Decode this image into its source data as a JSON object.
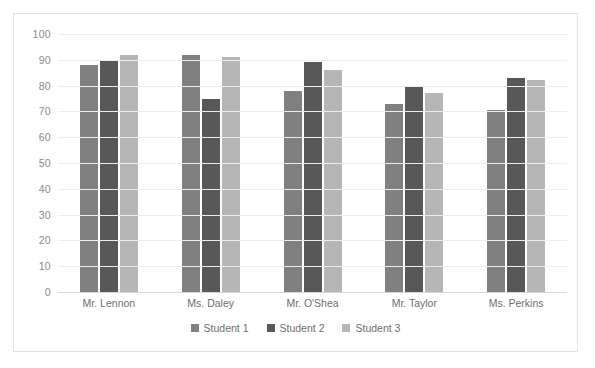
{
  "chart_data": {
    "type": "bar",
    "title": "",
    "subtitle": "",
    "xlabel": "",
    "ylabel": "",
    "ylim": [
      0,
      100
    ],
    "ytick_step": 10,
    "yticks": [
      100,
      90,
      80,
      70,
      60,
      50,
      40,
      30,
      20,
      10,
      0
    ],
    "grid": true,
    "legend_position": "bottom",
    "categories": [
      "Mr. Lennon",
      "Ms. Daley",
      "Mr. O'Shea",
      "Mr. Taylor",
      "Ms. Perkins"
    ],
    "series": [
      {
        "name": "Student 1",
        "color": "#808080",
        "values": [
          88,
          92,
          78,
          73,
          70.5
        ]
      },
      {
        "name": "Student 2",
        "color": "#585858",
        "values": [
          90,
          75,
          89,
          80,
          83
        ]
      },
      {
        "name": "Student 3",
        "color": "#b6b6b6",
        "values": [
          92,
          91,
          86,
          77,
          82
        ]
      }
    ]
  },
  "colors": {
    "series_1": "#808080",
    "series_2": "#585858",
    "series_3": "#b6b6b6",
    "gridline": "#ededed",
    "axis": "#d9d9d9",
    "border": "#e3e3e3",
    "tick_text": "#8c8c8c",
    "label_text": "#6e6e6e",
    "background": "#ffffff"
  }
}
